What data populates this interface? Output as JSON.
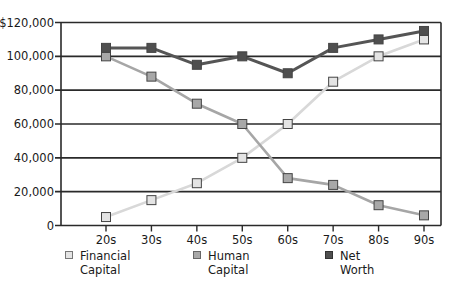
{
  "chart_data": {
    "type": "line",
    "title": "",
    "xlabel": "",
    "ylabel": "",
    "categories": [
      "20s",
      "30s",
      "40s",
      "50s",
      "60s",
      "70s",
      "80s",
      "90s"
    ],
    "ylim": [
      0,
      120000
    ],
    "yticks": [
      0,
      20000,
      40000,
      60000,
      80000,
      100000,
      120000
    ],
    "ytick_labels": [
      "0",
      "20,000",
      "40,000",
      "60,000",
      "80,000",
      "100,000",
      "$120,000"
    ],
    "grid": true,
    "legend_position": "bottom",
    "series": [
      {
        "name": "Financial Capital",
        "color": "#dcdcdc",
        "marker_fill": "#e4e4e4",
        "line_color": "#d8d8d8",
        "values": [
          5000,
          15000,
          25000,
          40000,
          60000,
          85000,
          100000,
          110000
        ]
      },
      {
        "name": "Human Capital",
        "color": "#9a9a9a",
        "marker_fill": "#a8a8a8",
        "line_color": "#a6a6a6",
        "values": [
          100000,
          88000,
          72000,
          60000,
          28000,
          24000,
          12000,
          6000
        ]
      },
      {
        "name": "Net Worth",
        "color": "#4a4a4a",
        "marker_fill": "#4f4f4f",
        "line_color": "#555555",
        "values": [
          105000,
          105000,
          95000,
          100000,
          90000,
          105000,
          110000,
          115000
        ]
      }
    ]
  },
  "legend": {
    "items": [
      {
        "label_line1": "Financial",
        "label_line2": "Capital"
      },
      {
        "label_line1": "Human",
        "label_line2": "Capital"
      },
      {
        "label_line1": "Net",
        "label_line2": "Worth"
      }
    ]
  }
}
